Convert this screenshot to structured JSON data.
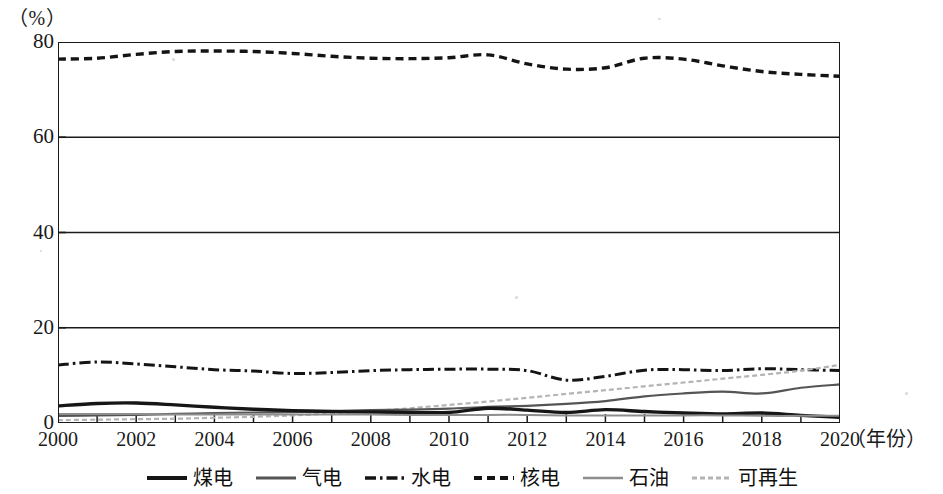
{
  "axes": {
    "unit_label": "（%）",
    "x_caption": "（年份）",
    "y_ticks": [
      "0",
      "20",
      "40",
      "60",
      "80"
    ],
    "x_ticks": [
      "2000",
      "2002",
      "2004",
      "2006",
      "2008",
      "2010",
      "2012",
      "2014",
      "2016",
      "2018",
      "2020"
    ]
  },
  "legend": {
    "items": [
      {
        "label": "煤电",
        "style": "solid-thick",
        "color": "#161616"
      },
      {
        "label": "气电",
        "style": "solid-medium",
        "color": "#555555"
      },
      {
        "label": "水电",
        "style": "dash-dot",
        "color": "#141414"
      },
      {
        "label": "核电",
        "style": "dotted",
        "color": "#141414"
      },
      {
        "label": "石油",
        "style": "solid-light",
        "color": "#8d8d8d"
      },
      {
        "label": "可再生",
        "style": "dashed-light",
        "color": "#b4b4b4"
      }
    ]
  },
  "chart_data": {
    "type": "line",
    "title": "",
    "subtitle": "",
    "xlabel": "（年份）",
    "ylabel": "（%）",
    "xlim": [
      2000,
      2020
    ],
    "ylim": [
      0,
      80
    ],
    "ytick_values": [
      0,
      20,
      40,
      60,
      80
    ],
    "grid": "horizontal",
    "legend_position": "bottom-center",
    "x": [
      2000,
      2001,
      2002,
      2003,
      2004,
      2005,
      2006,
      2007,
      2008,
      2009,
      2010,
      2011,
      2012,
      2013,
      2014,
      2015,
      2016,
      2017,
      2018,
      2019,
      2020
    ],
    "series": [
      {
        "name": "核电",
        "style": "dotted",
        "color": "#141414",
        "values": [
          76.4,
          76.6,
          77.4,
          78.0,
          78.1,
          78.0,
          77.6,
          77.0,
          76.6,
          76.5,
          76.7,
          77.3,
          75.4,
          74.3,
          74.6,
          76.6,
          76.4,
          75.0,
          73.8,
          73.2,
          72.8
        ]
      },
      {
        "name": "水电",
        "style": "dash-dot",
        "color": "#141414",
        "values": [
          12.2,
          12.8,
          12.4,
          11.8,
          11.2,
          10.9,
          10.4,
          10.6,
          11.0,
          11.2,
          11.3,
          11.3,
          11.0,
          9.0,
          9.8,
          11.1,
          11.2,
          11.0,
          11.4,
          11.2,
          11.0
        ]
      },
      {
        "name": "可再生",
        "style": "dashed-light",
        "color": "#b4b4b4",
        "values": [
          0.6,
          0.7,
          0.8,
          0.9,
          1.1,
          1.3,
          1.6,
          2.0,
          2.5,
          3.1,
          3.8,
          4.5,
          5.3,
          6.1,
          6.9,
          7.7,
          8.5,
          9.3,
          10.1,
          11.0,
          12.2
        ]
      },
      {
        "name": "气电",
        "style": "solid-medium",
        "color": "#555555",
        "values": [
          1.5,
          1.6,
          1.7,
          1.9,
          2.1,
          2.2,
          2.3,
          2.5,
          2.7,
          2.8,
          3.0,
          3.4,
          3.6,
          4.0,
          4.6,
          5.6,
          6.2,
          6.6,
          6.2,
          7.4,
          8.1
        ]
      },
      {
        "name": "煤电",
        "style": "solid-thick",
        "color": "#161616",
        "values": [
          3.6,
          4.1,
          4.2,
          3.8,
          3.3,
          2.9,
          2.6,
          2.4,
          2.3,
          2.2,
          2.2,
          3.1,
          2.7,
          2.2,
          2.8,
          2.4,
          2.1,
          1.9,
          2.1,
          1.6,
          1.2
        ]
      },
      {
        "name": "石油",
        "style": "solid-light",
        "color": "#8d8d8d",
        "values": [
          1.9,
          1.9,
          1.9,
          1.8,
          1.8,
          1.8,
          1.8,
          1.8,
          1.8,
          1.7,
          1.7,
          1.7,
          1.7,
          1.6,
          1.6,
          1.6,
          1.6,
          1.6,
          1.5,
          1.5,
          1.5
        ]
      }
    ]
  }
}
